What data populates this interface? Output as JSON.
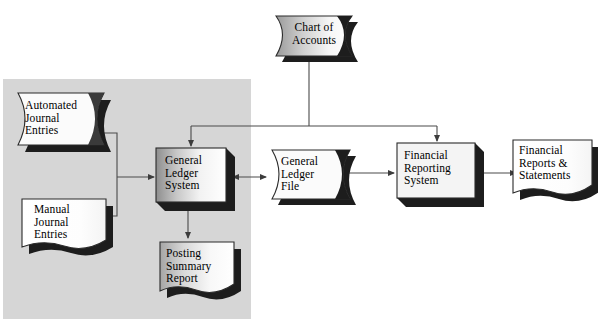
{
  "diagram": {
    "type": "flowchart",
    "background_color": "#ffffff",
    "panel_color": "#d4d4d4",
    "line_color": "#4a4a4a",
    "shadow_color": "#1a1a1a",
    "text_color": "#000000",
    "panel": {
      "name": "general-ledger-subsystem-panel",
      "x": 3,
      "y": 79,
      "width": 248,
      "height": 240
    },
    "nodes": [
      {
        "id": "chart-of-accounts",
        "label": "Chart of\nAccounts",
        "shape": "magnetic-tape",
        "x": 263,
        "y": 8,
        "width": 92,
        "height": 52
      },
      {
        "id": "automated-journal-entries",
        "label": "Automated\nJournal\nEntries",
        "shape": "magnetic-tape",
        "x": 14,
        "y": 91,
        "width": 96,
        "height": 55
      },
      {
        "id": "manual-journal-entries",
        "label": "Manual\nJournal\nEntries",
        "shape": "document",
        "x": 20,
        "y": 196,
        "width": 87,
        "height": 53
      },
      {
        "id": "general-ledger-system",
        "label": "General\nLedger\nSystem",
        "shape": "process-box-3d",
        "x": 156,
        "y": 148,
        "width": 70,
        "height": 54
      },
      {
        "id": "general-ledger-file",
        "label": "General\nLedger\nFile",
        "shape": "magnetic-tape",
        "x": 269,
        "y": 148,
        "width": 82,
        "height": 53
      },
      {
        "id": "financial-reporting-system",
        "label": "Financial\nReporting\nSystem",
        "shape": "process-box-3d",
        "x": 397,
        "y": 143,
        "width": 78,
        "height": 55
      },
      {
        "id": "financial-reports-statements",
        "label": "Financial\nReports &\nStatements",
        "shape": "document",
        "x": 511,
        "y": 138,
        "width": 82,
        "height": 57
      },
      {
        "id": "posting-summary-report",
        "label": "Posting\nSummary\nReport",
        "shape": "document",
        "x": 158,
        "y": 240,
        "width": 76,
        "height": 55
      }
    ],
    "connectors": [
      {
        "id": "chart-to-gl-system",
        "from": "chart-of-accounts",
        "to": "general-ledger-system",
        "arrow": "single"
      },
      {
        "id": "chart-to-financial-reporting",
        "from": "chart-of-accounts",
        "to": "financial-reporting-system",
        "arrow": "single"
      },
      {
        "id": "journal-entries-to-gl-system",
        "from": "automated-journal-entries",
        "to": "general-ledger-system",
        "arrow": "single"
      },
      {
        "id": "manual-entries-to-gl-system",
        "from": "manual-journal-entries",
        "to": "general-ledger-system",
        "arrow": "single"
      },
      {
        "id": "gl-system-to-gl-file",
        "from": "general-ledger-system",
        "to": "general-ledger-file",
        "arrow": "double"
      },
      {
        "id": "gl-file-to-financial-reporting",
        "from": "general-ledger-file",
        "to": "financial-reporting-system",
        "arrow": "single"
      },
      {
        "id": "financial-reporting-to-reports",
        "from": "financial-reporting-system",
        "to": "financial-reports-statements",
        "arrow": "single"
      },
      {
        "id": "gl-system-to-posting-summary",
        "from": "general-ledger-system",
        "to": "posting-summary-report",
        "arrow": "single"
      }
    ]
  }
}
